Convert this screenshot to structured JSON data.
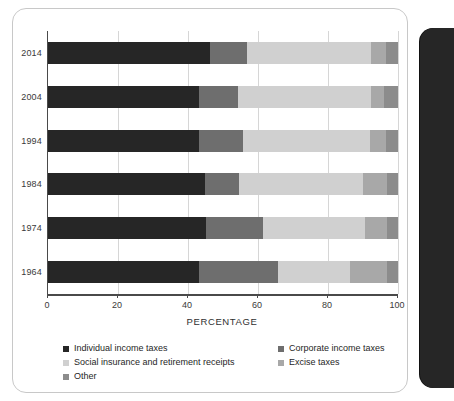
{
  "chart_data": {
    "type": "bar",
    "subtype": "stacked-horizontal-100pct",
    "title": "",
    "xlabel": "PERCENTAGE",
    "ylabel": "",
    "xlim": [
      0,
      100
    ],
    "xticks": [
      0,
      20,
      40,
      60,
      80,
      100
    ],
    "xtick_labels": [
      "0",
      "20",
      "40",
      "60",
      "80",
      "100"
    ],
    "grid": true,
    "grid_axis": "x",
    "legend_position": "bottom",
    "categories": [
      "2014",
      "2004",
      "1994",
      "1984",
      "1974",
      "1964"
    ],
    "series": [
      {
        "name": "Individual income taxes",
        "color": "#262626",
        "values": [
          46.2,
          43.0,
          43.1,
          44.8,
          45.0,
          43.2
        ]
      },
      {
        "name": "Corporate income taxes",
        "color": "#6e6e6e",
        "values": [
          10.6,
          11.4,
          12.6,
          9.7,
          16.3,
          22.6
        ]
      },
      {
        "name": "Social insurance and retirement receipts",
        "color": "#d0d0d0",
        "values": [
          35.4,
          38.0,
          36.4,
          35.5,
          29.2,
          20.6
        ]
      },
      {
        "name": "Excise taxes",
        "color": "#a8a8a8",
        "values": [
          4.3,
          3.6,
          4.6,
          6.9,
          6.4,
          10.6
        ]
      },
      {
        "name": "Other",
        "color": "#8c8c8c",
        "values": [
          3.5,
          4.0,
          3.3,
          3.1,
          3.1,
          3.0
        ]
      }
    ]
  },
  "axis": {
    "x_title": "PERCENTAGE",
    "tick_labels": [
      "0",
      "20",
      "40",
      "60",
      "80",
      "100"
    ],
    "year_labels": [
      "2014",
      "2004",
      "1994",
      "1984",
      "1974",
      "1964"
    ]
  },
  "legend": {
    "rows": [
      {
        "left": {
          "label": "Individual income taxes",
          "color": "#262626"
        },
        "right": {
          "label": "Corporate income taxes",
          "color": "#6e6e6e"
        }
      },
      {
        "left": {
          "label": "Social insurance and retirement receipts",
          "color": "#d0d0d0"
        },
        "right": {
          "label": "Excise taxes",
          "color": "#a8a8a8"
        }
      },
      {
        "left": {
          "label": "Other",
          "color": "#8c8c8c"
        },
        "right": null
      }
    ]
  }
}
